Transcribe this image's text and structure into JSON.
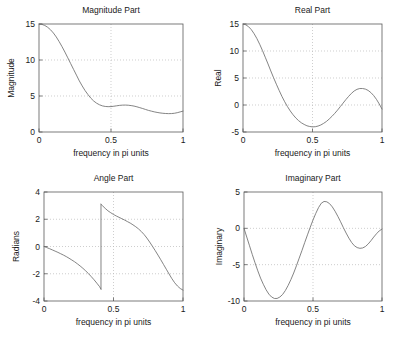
{
  "figure": {
    "background": "#ffffff",
    "axis_color": "#5a5a5a",
    "grid_color": "#b9b9b9",
    "curve_color": "#6e6e6e",
    "width": 394,
    "height": 340
  },
  "chart_data": [
    {
      "type": "line",
      "id": "magnitude",
      "title": "Magnitude Part",
      "xlabel": "frequency in pi units",
      "ylabel": "Magnitude",
      "xlim": [
        0,
        1
      ],
      "ylim": [
        0,
        15
      ],
      "xticks": [
        0,
        0.5,
        1
      ],
      "xticklabels": [
        "0",
        "0.5",
        "1"
      ],
      "yticks": [
        0,
        5,
        10,
        15
      ],
      "yticklabels": [
        "0",
        "5",
        "10",
        "15"
      ],
      "grid": true,
      "legend": null,
      "x": [
        0,
        0.02,
        0.04,
        0.06,
        0.08,
        0.1,
        0.12,
        0.14,
        0.16,
        0.18,
        0.2,
        0.22,
        0.24,
        0.26,
        0.28,
        0.3,
        0.32,
        0.34,
        0.36,
        0.38,
        0.4,
        0.42,
        0.44,
        0.46,
        0.48,
        0.5,
        0.52,
        0.54,
        0.56,
        0.58,
        0.6,
        0.62,
        0.64,
        0.66,
        0.68,
        0.7,
        0.72,
        0.74,
        0.76,
        0.78,
        0.8,
        0.82,
        0.84,
        0.86,
        0.88,
        0.9,
        0.92,
        0.94,
        0.96,
        0.98,
        1.0
      ],
      "values": [
        15.0,
        14.95,
        14.8,
        14.55,
        14.2,
        13.75,
        13.2,
        12.55,
        11.85,
        11.1,
        10.3,
        9.5,
        8.7,
        7.9,
        7.1,
        6.4,
        5.75,
        5.2,
        4.7,
        4.3,
        4.0,
        3.78,
        3.63,
        3.55,
        3.52,
        3.53,
        3.58,
        3.64,
        3.7,
        3.73,
        3.74,
        3.72,
        3.67,
        3.6,
        3.5,
        3.38,
        3.26,
        3.13,
        3.0,
        2.9,
        2.8,
        2.72,
        2.65,
        2.6,
        2.57,
        2.55,
        2.56,
        2.6,
        2.68,
        2.79,
        2.9
      ]
    },
    {
      "type": "line",
      "id": "real",
      "title": "Real Part",
      "xlabel": "frequency in pi units",
      "ylabel": "Real",
      "xlim": [
        0,
        1
      ],
      "ylim": [
        -5,
        15
      ],
      "xticks": [
        0,
        0.5,
        1
      ],
      "xticklabels": [
        "0",
        "0.5",
        "1"
      ],
      "yticks": [
        -5,
        0,
        5,
        10,
        15
      ],
      "yticklabels": [
        "-5",
        "0",
        "5",
        "10",
        "15"
      ],
      "grid": true,
      "legend": null,
      "x": [
        0,
        0.02,
        0.04,
        0.06,
        0.08,
        0.1,
        0.12,
        0.14,
        0.16,
        0.18,
        0.2,
        0.22,
        0.24,
        0.26,
        0.28,
        0.3,
        0.32,
        0.34,
        0.36,
        0.38,
        0.4,
        0.42,
        0.44,
        0.46,
        0.48,
        0.5,
        0.52,
        0.54,
        0.56,
        0.58,
        0.6,
        0.62,
        0.64,
        0.66,
        0.68,
        0.7,
        0.72,
        0.74,
        0.76,
        0.78,
        0.8,
        0.82,
        0.84,
        0.86,
        0.88,
        0.9,
        0.92,
        0.94,
        0.96,
        0.98,
        1.0
      ],
      "values": [
        15.0,
        14.85,
        14.5,
        13.95,
        13.2,
        12.3,
        11.25,
        10.1,
        8.85,
        7.6,
        6.3,
        5.05,
        3.85,
        2.7,
        1.6,
        0.6,
        -0.3,
        -1.1,
        -1.8,
        -2.4,
        -2.9,
        -3.3,
        -3.6,
        -3.85,
        -3.98,
        -4.05,
        -4.02,
        -3.9,
        -3.7,
        -3.4,
        -3.05,
        -2.6,
        -2.1,
        -1.55,
        -0.95,
        -0.3,
        0.35,
        1.0,
        1.6,
        2.15,
        2.6,
        2.9,
        3.05,
        3.05,
        2.95,
        2.7,
        2.3,
        1.75,
        1.05,
        0.2,
        -0.75
      ]
    },
    {
      "type": "line",
      "id": "angle",
      "title": "Angle Part",
      "xlabel": "frequency in pi units",
      "ylabel": "Radians",
      "xlim": [
        0,
        1
      ],
      "ylim": [
        -4,
        4
      ],
      "xticks": [
        0,
        0.5,
        1
      ],
      "xticklabels": [
        "0",
        "0.5",
        "1"
      ],
      "yticks": [
        -4,
        -2,
        0,
        2,
        4
      ],
      "yticklabels": [
        "-4",
        "-2",
        "0",
        "2",
        "4"
      ],
      "grid": true,
      "legend": null,
      "branch_discontinuity_x": 0.41,
      "segments": [
        {
          "x": [
            0,
            0.02,
            0.04,
            0.06,
            0.08,
            0.1,
            0.12,
            0.14,
            0.16,
            0.18,
            0.2,
            0.22,
            0.24,
            0.26,
            0.28,
            0.3,
            0.32,
            0.34,
            0.36,
            0.38,
            0.4,
            0.41
          ],
          "values": [
            0.0,
            -0.08,
            -0.16,
            -0.25,
            -0.34,
            -0.43,
            -0.53,
            -0.63,
            -0.74,
            -0.86,
            -0.99,
            -1.12,
            -1.27,
            -1.43,
            -1.6,
            -1.79,
            -1.99,
            -2.21,
            -2.44,
            -2.69,
            -2.95,
            -3.13
          ]
        },
        {
          "x": [
            0.41,
            0.42,
            0.44,
            0.46,
            0.48,
            0.5,
            0.52,
            0.54,
            0.56,
            0.58,
            0.6,
            0.62,
            0.64,
            0.66,
            0.68,
            0.7,
            0.72,
            0.74,
            0.76,
            0.78,
            0.8,
            0.82,
            0.84,
            0.86,
            0.88,
            0.9,
            0.92,
            0.94,
            0.96,
            0.98,
            1.0
          ],
          "values": [
            3.1,
            3.0,
            2.8,
            2.62,
            2.48,
            2.35,
            2.24,
            2.14,
            2.04,
            1.94,
            1.83,
            1.72,
            1.59,
            1.45,
            1.29,
            1.1,
            0.88,
            0.62,
            0.33,
            0.02,
            -0.3,
            -0.63,
            -0.97,
            -1.32,
            -1.67,
            -2.02,
            -2.36,
            -2.66,
            -2.9,
            -3.08,
            -3.2
          ]
        }
      ]
    },
    {
      "type": "line",
      "id": "imaginary",
      "title": "Imaginary Part",
      "xlabel": "frequency in pi units",
      "ylabel": "Imaginary",
      "xlim": [
        0,
        1
      ],
      "ylim": [
        -10,
        5
      ],
      "xticks": [
        0,
        0.5,
        1
      ],
      "xticklabels": [
        "0",
        "0.5",
        "1"
      ],
      "yticks": [
        -10,
        -5,
        0,
        5
      ],
      "yticklabels": [
        "-10",
        "-5",
        "0",
        "5"
      ],
      "grid": true,
      "legend": null,
      "x": [
        0,
        0.02,
        0.04,
        0.06,
        0.08,
        0.1,
        0.12,
        0.14,
        0.16,
        0.18,
        0.2,
        0.22,
        0.24,
        0.26,
        0.28,
        0.3,
        0.32,
        0.34,
        0.36,
        0.38,
        0.4,
        0.42,
        0.44,
        0.46,
        0.48,
        0.5,
        0.52,
        0.54,
        0.56,
        0.58,
        0.6,
        0.62,
        0.64,
        0.66,
        0.68,
        0.7,
        0.72,
        0.74,
        0.76,
        0.78,
        0.8,
        0.82,
        0.84,
        0.86,
        0.88,
        0.9,
        0.92,
        0.94,
        0.96,
        0.98,
        1.0
      ],
      "values": [
        0.0,
        -1.2,
        -2.4,
        -3.6,
        -4.75,
        -5.85,
        -6.85,
        -7.7,
        -8.45,
        -9.05,
        -9.45,
        -9.65,
        -9.65,
        -9.45,
        -9.1,
        -8.55,
        -7.85,
        -7.05,
        -6.15,
        -5.15,
        -4.1,
        -3.05,
        -1.95,
        -0.9,
        0.15,
        1.15,
        2.05,
        2.85,
        3.45,
        3.7,
        3.65,
        3.4,
        2.95,
        2.35,
        1.65,
        0.9,
        0.1,
        -0.65,
        -1.35,
        -1.95,
        -2.4,
        -2.65,
        -2.75,
        -2.7,
        -2.5,
        -2.15,
        -1.7,
        -1.2,
        -0.75,
        -0.35,
        -0.1
      ]
    }
  ]
}
